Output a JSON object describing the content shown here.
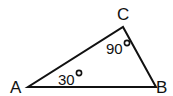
{
  "diagram": {
    "type": "triangle",
    "stroke_color": "#111111",
    "vertices": [
      {
        "name": "A",
        "x": 28,
        "y": 87
      },
      {
        "name": "B",
        "x": 156,
        "y": 87
      },
      {
        "name": "C",
        "x": 123,
        "y": 27
      }
    ],
    "labels": {
      "A": "A",
      "B": "B",
      "C": "C"
    },
    "angles": {
      "A": {
        "value": "30",
        "unit": "°"
      },
      "C": {
        "value": "90",
        "unit": "°"
      }
    }
  }
}
